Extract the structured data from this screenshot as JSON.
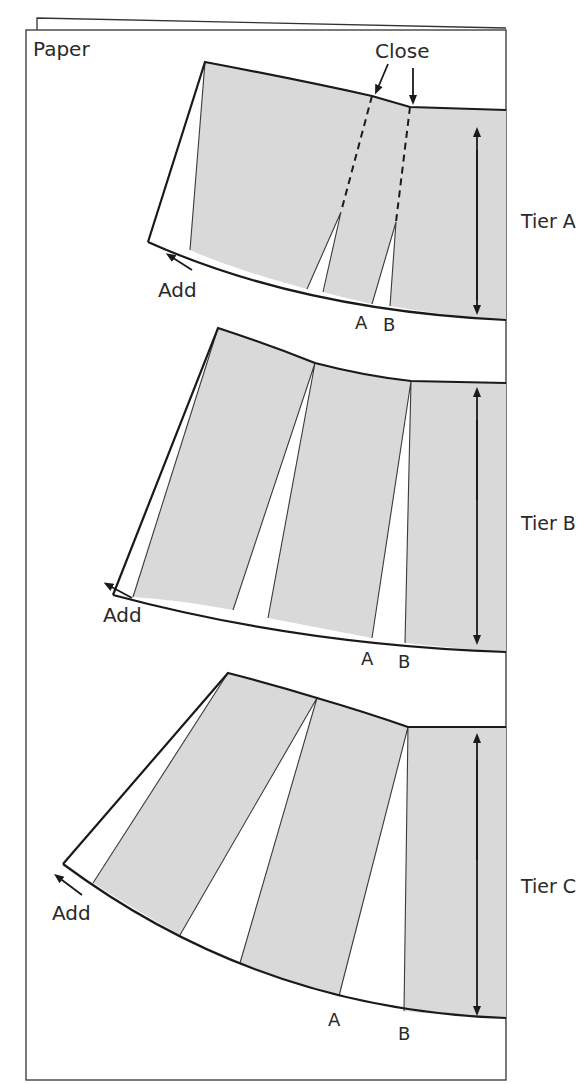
{
  "figure": {
    "paper_label": "Paper",
    "close_label": "Close",
    "tiers": [
      {
        "name": "Tier A",
        "add_label": "Add",
        "point_a": "A",
        "point_b": "B"
      },
      {
        "name": "Tier B",
        "add_label": "Add",
        "point_a": "A",
        "point_b": "B"
      },
      {
        "name": "Tier C",
        "add_label": "Add",
        "point_a": "A",
        "point_b": "B"
      }
    ],
    "colors": {
      "pattern_fill": "#d9d9d9",
      "outline": "#1a1a1a",
      "paper": "#ffffff"
    }
  }
}
